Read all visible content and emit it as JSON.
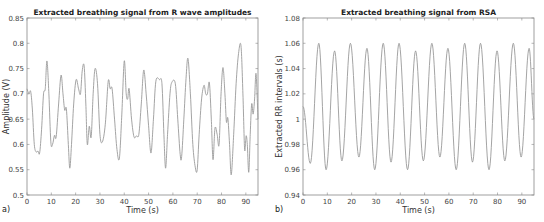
{
  "chart_data": [
    {
      "type": "line",
      "panel_label": "a)",
      "title": "Extracted breathing signal from R wave amplitudes",
      "xlabel": "Time (s)",
      "ylabel": "Amplitude (V)",
      "xlim": [
        0,
        95
      ],
      "ylim": [
        0.5,
        0.85
      ],
      "xticks": [
        0,
        10,
        20,
        30,
        40,
        50,
        60,
        70,
        80,
        90
      ],
      "yticks": [
        0.5,
        0.55,
        0.6,
        0.65,
        0.7,
        0.75,
        0.8,
        0.85
      ],
      "ytick_labels": [
        "0.5",
        "0.55",
        "0.6",
        "0.65",
        "0.7",
        "0.75",
        "0.8",
        "0.85"
      ],
      "grid": false,
      "series": [
        {
          "name": "R wave amplitude breathing signal",
          "color": "#9a9a9a",
          "x": [
            0,
            0.8,
            1.5,
            2.2,
            3.0,
            3.8,
            4.5,
            5.2,
            6.0,
            6.8,
            7.5,
            8.2,
            9.0,
            9.8,
            10.5,
            11.3,
            12.0,
            13.0,
            14.0,
            14.8,
            15.5,
            16.2,
            17.0,
            17.6,
            18.3,
            19.2,
            20.2,
            21.2,
            22.0,
            22.7,
            23.5,
            24.2,
            24.8,
            25.6,
            26.4,
            27.2,
            28.0,
            29.0,
            30.0,
            31.0,
            32.2,
            33.4,
            34.2,
            35.0,
            36.0,
            37.0,
            38.0,
            39.0,
            40.0,
            40.8,
            41.4,
            42.0,
            43.0,
            44.0,
            45.0,
            46.0,
            47.0,
            48.0,
            49.0,
            50.0,
            51.0,
            52.0,
            53.0,
            54.5,
            55.5,
            56.3,
            57.0,
            57.8,
            58.8,
            59.6,
            61.0,
            62.0,
            63.0,
            63.6,
            64.5,
            65.4,
            66.2,
            67.2,
            68.2,
            69.2,
            70.0,
            70.8,
            71.8,
            72.8,
            73.5,
            74.2,
            75.0,
            75.8,
            76.5,
            77.3,
            78.2,
            79.0,
            79.8,
            80.6,
            81.4,
            82.0,
            82.6,
            83.3,
            84.0,
            85.0,
            86.0,
            87.0,
            88.0,
            88.8,
            89.5,
            90.1,
            90.6,
            91.2,
            91.8,
            92.4,
            93.0,
            93.6,
            94.2,
            95.0
          ],
          "y": [
            0.71,
            0.7,
            0.705,
            0.67,
            0.6,
            0.585,
            0.587,
            0.583,
            0.63,
            0.7,
            0.71,
            0.765,
            0.7,
            0.605,
            0.6,
            0.618,
            0.615,
            0.68,
            0.737,
            0.7,
            0.668,
            0.67,
            0.6,
            0.553,
            0.6,
            0.68,
            0.728,
            0.71,
            0.7,
            0.745,
            0.755,
            0.68,
            0.6,
            0.636,
            0.615,
            0.7,
            0.75,
            0.72,
            0.62,
            0.605,
            0.64,
            0.725,
            0.71,
            0.71,
            0.65,
            0.59,
            0.573,
            0.66,
            0.765,
            0.7,
            0.69,
            0.71,
            0.65,
            0.615,
            0.617,
            0.62,
            0.68,
            0.747,
            0.7,
            0.637,
            0.583,
            0.65,
            0.725,
            0.728,
            0.72,
            0.62,
            0.553,
            0.62,
            0.7,
            0.723,
            0.72,
            0.65,
            0.58,
            0.576,
            0.65,
            0.73,
            0.77,
            0.7,
            0.6,
            0.555,
            0.55,
            0.62,
            0.69,
            0.717,
            0.7,
            0.7,
            0.722,
            0.65,
            0.57,
            0.632,
            0.62,
            0.6,
            0.7,
            0.752,
            0.7,
            0.645,
            0.652,
            0.6,
            0.54,
            0.62,
            0.72,
            0.78,
            0.795,
            0.7,
            0.59,
            0.617,
            0.6,
            0.545,
            0.62,
            0.68,
            0.66,
            0.69,
            0.74,
            0.65
          ]
        }
      ]
    },
    {
      "type": "line",
      "panel_label": "b)",
      "title": "Extracted breathing signal from RSA",
      "xlabel": "Time (s)",
      "ylabel": "Extracted RR intervals (s)",
      "xlim": [
        0,
        95
      ],
      "ylim": [
        0.94,
        1.08
      ],
      "xticks": [
        0,
        10,
        20,
        30,
        40,
        50,
        60,
        70,
        80,
        90
      ],
      "yticks": [
        0.94,
        0.96,
        0.98,
        1.0,
        1.02,
        1.04,
        1.06,
        1.08
      ],
      "ytick_labels": [
        "0.94",
        "0.96",
        "0.98",
        "1",
        "1.02",
        "1.04",
        "1.06",
        "1.08"
      ],
      "grid": false,
      "series": [
        {
          "name": "RSA breathing signal",
          "color": "#9a9a9a",
          "extrema_t": [
            0,
            3.0,
            6.5,
            9.5,
            13.0,
            16.0,
            19.5,
            23.0,
            26.3,
            29.5,
            33.0,
            36.2,
            39.5,
            43.0,
            46.3,
            49.5,
            53.0,
            56.3,
            59.6,
            63.0,
            66.5,
            69.7,
            73.0,
            76.5,
            79.8,
            83.0,
            86.5,
            89.7,
            93.0,
            95.0
          ],
          "extrema_v": [
            1.01,
            0.965,
            1.06,
            0.96,
            1.054,
            0.967,
            1.06,
            0.97,
            1.056,
            0.96,
            1.06,
            0.966,
            1.06,
            0.96,
            1.054,
            0.967,
            1.06,
            0.97,
            1.056,
            0.96,
            1.06,
            0.966,
            1.06,
            0.96,
            1.054,
            0.967,
            1.06,
            0.97,
            1.056,
            1.0
          ]
        }
      ]
    }
  ]
}
